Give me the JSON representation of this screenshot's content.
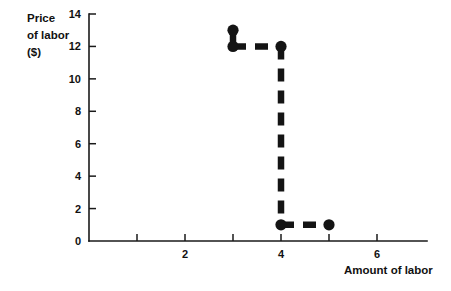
{
  "chart_data": {
    "type": "line",
    "title": "",
    "xlabel": "Amount of labor",
    "ylabel": "Price of labor ($)",
    "ylabel_lines": [
      "Price",
      "of labor",
      "($)"
    ],
    "xlim": [
      0,
      7
    ],
    "ylim": [
      0,
      14
    ],
    "grid": false,
    "legend": "none",
    "x_ticks": [
      1,
      2,
      3,
      4,
      5,
      6
    ],
    "x_tick_labels": [
      "",
      "2",
      "",
      "4",
      "",
      "6"
    ],
    "y_ticks": [
      0,
      2,
      4,
      6,
      8,
      10,
      12,
      14
    ],
    "y_tick_labels": [
      "0",
      "2",
      "4",
      "6",
      "8",
      "10",
      "12",
      "14"
    ],
    "series": [
      {
        "name": "marginal factor cost",
        "style": "dashed-step",
        "points": [
          {
            "x": 3,
            "y": 13
          },
          {
            "x": 3,
            "y": 12
          },
          {
            "x": 4,
            "y": 12
          },
          {
            "x": 4,
            "y": 1
          },
          {
            "x": 5,
            "y": 1
          }
        ],
        "markers": [
          {
            "x": 3,
            "y": 13
          },
          {
            "x": 3,
            "y": 12
          },
          {
            "x": 4,
            "y": 12
          },
          {
            "x": 4,
            "y": 1
          },
          {
            "x": 5,
            "y": 1
          }
        ],
        "segments": [
          {
            "from": {
              "x": 3,
              "y": 13
            },
            "to": {
              "x": 3,
              "y": 12
            },
            "style": "solid"
          },
          {
            "from": {
              "x": 3,
              "y": 12
            },
            "to": {
              "x": 4,
              "y": 12
            },
            "style": "dashed"
          },
          {
            "from": {
              "x": 4,
              "y": 12
            },
            "to": {
              "x": 4,
              "y": 1
            },
            "style": "dashed"
          },
          {
            "from": {
              "x": 4,
              "y": 1
            },
            "to": {
              "x": 5,
              "y": 1
            },
            "style": "dashed"
          }
        ]
      }
    ],
    "colors": {
      "series": "#141414",
      "axis": "#1a1a1a",
      "background": "#ffffff"
    }
  }
}
